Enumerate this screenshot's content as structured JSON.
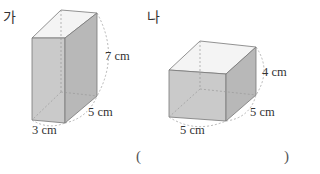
{
  "figures": [
    {
      "id": "ga",
      "label": "가",
      "dimensions": {
        "height": "7 cm",
        "depth": "5 cm",
        "width": "3 cm"
      }
    },
    {
      "id": "na",
      "label": "나",
      "dimensions": {
        "height": "4 cm",
        "depth": "5 cm",
        "width": "5 cm"
      }
    }
  ],
  "answer": {
    "open": "(",
    "close": ")",
    "value": ""
  },
  "colors": {
    "front_face": "#c8c8c8",
    "side_face": "#b4b4b4",
    "top_face": "#f2f2f2",
    "edge": "#777777",
    "dashed": "#999999"
  }
}
